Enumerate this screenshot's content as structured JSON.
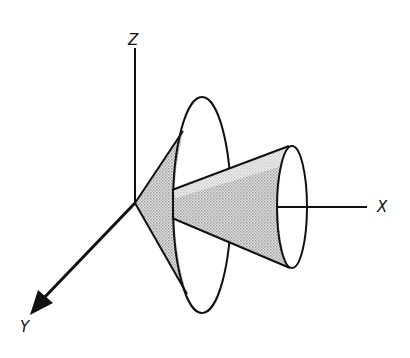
{
  "diagram": {
    "type": "3d-axes-with-cones",
    "axes": {
      "z_label": "Z",
      "x_label": "X",
      "y_label": "Y"
    },
    "colors": {
      "line": "#111111",
      "shade": "#c8c8c8",
      "background": "#ffffff"
    }
  }
}
